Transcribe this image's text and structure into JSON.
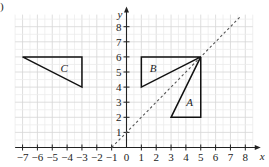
{
  "corner_label": ")",
  "chart_data": {
    "type": "scatter",
    "title": "",
    "xlabel": "x",
    "ylabel": "y",
    "xlim": [
      -7.5,
      8.5
    ],
    "ylim": [
      0,
      8.8
    ],
    "grid": true,
    "x_ticks": [
      -7,
      -6,
      -5,
      -4,
      -3,
      -2,
      -1,
      0,
      1,
      2,
      3,
      4,
      5,
      6,
      7,
      8
    ],
    "y_ticks": [
      1,
      2,
      3,
      4,
      5,
      6,
      7,
      8
    ],
    "shapes": [
      {
        "name": "C",
        "vertices": [
          [
            -7,
            6
          ],
          [
            -3,
            6
          ],
          [
            -3,
            4
          ]
        ],
        "label_pos": [
          -4.2,
          5.25
        ]
      },
      {
        "name": "B",
        "vertices": [
          [
            1,
            6
          ],
          [
            5,
            6
          ],
          [
            1,
            4
          ]
        ],
        "label_pos": [
          1.8,
          5.25
        ]
      },
      {
        "name": "A",
        "vertices": [
          [
            5,
            6
          ],
          [
            5,
            2
          ],
          [
            3,
            2
          ]
        ],
        "label_pos": [
          4.25,
          3
        ]
      }
    ],
    "lines": [
      {
        "name": "mirror line",
        "equation": "y = x + 1",
        "style": "dashed",
        "from": [
          -1,
          0
        ],
        "to": [
          7.7,
          8.7
        ]
      }
    ]
  }
}
